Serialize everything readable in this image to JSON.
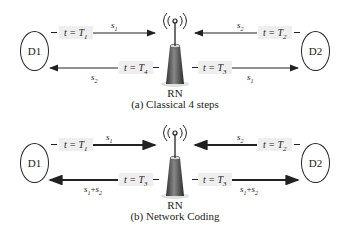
{
  "panel_a": {
    "caption": "(a) Classical 4 steps",
    "left_node": "D1",
    "right_node": "D2",
    "relay": "RN",
    "arrows": [
      {
        "from": "D1",
        "to": "RN",
        "time": "t = T1",
        "time_var": "t = T",
        "time_sub": "1",
        "signal": "s",
        "signal_sub": "1"
      },
      {
        "from": "D2",
        "to": "RN",
        "time": "t = T2",
        "time_var": "t = T",
        "time_sub": "2",
        "signal": "s",
        "signal_sub": "2"
      },
      {
        "from": "RN",
        "to": "D1",
        "time": "t = T4",
        "time_var": "t = T",
        "time_sub": "4",
        "signal": "s",
        "signal_sub": "2"
      },
      {
        "from": "RN",
        "to": "D2",
        "time": "t = T3",
        "time_var": "t = T",
        "time_sub": "3",
        "signal": "s",
        "signal_sub": "1"
      }
    ]
  },
  "panel_b": {
    "caption": "(b) Network Coding",
    "left_node": "D1",
    "right_node": "D2",
    "relay": "RN",
    "arrows": [
      {
        "from": "D1",
        "to": "RN",
        "time": "t = T1",
        "time_var": "t = T",
        "time_sub": "1",
        "signal": "s",
        "signal_sub": "1"
      },
      {
        "from": "D2",
        "to": "RN",
        "time": "t = T2",
        "time_var": "t = T",
        "time_sub": "2",
        "signal": "s",
        "signal_sub": "2"
      },
      {
        "from": "RN",
        "to": "D1",
        "time": "t = T3",
        "time_var": "t = T",
        "time_sub": "3",
        "signal": "s1+s2",
        "signal_a": "s",
        "signal_a_sub": "1",
        "signal_plus": "+",
        "signal_b": "s",
        "signal_b_sub": "2"
      },
      {
        "from": "RN",
        "to": "D2",
        "time": "t = T3",
        "time_var": "t = T",
        "time_sub": "3",
        "signal": "s1+s2",
        "signal_a": "s",
        "signal_a_sub": "1",
        "signal_plus": "+",
        "signal_b": "s",
        "signal_b_sub": "2"
      }
    ]
  }
}
